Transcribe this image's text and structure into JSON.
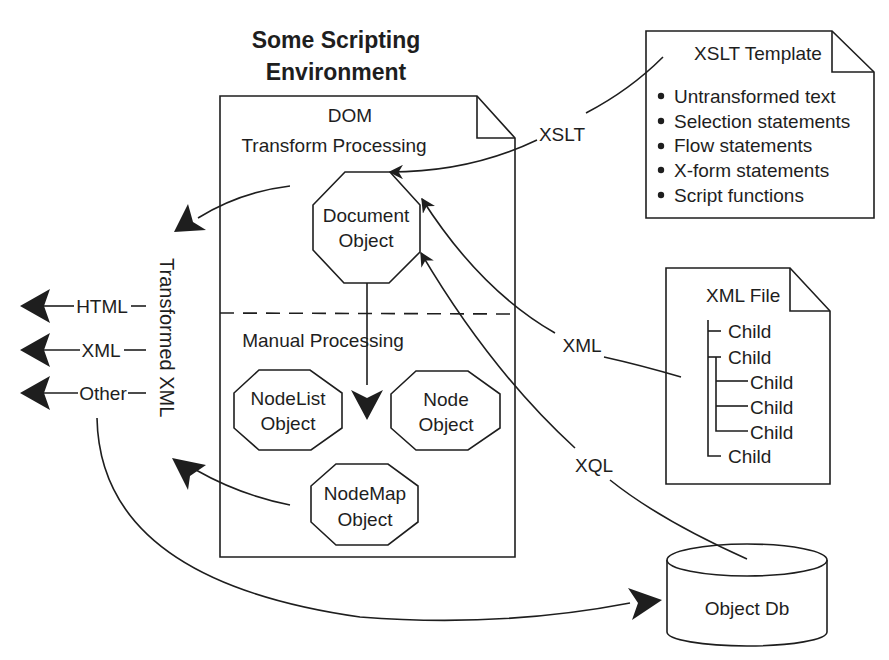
{
  "title": {
    "line1": "Some Scripting",
    "line2": "Environment"
  },
  "dom_page": {
    "heading": "DOM",
    "transform_section": "Transform Processing",
    "manual_section": "Manual Processing",
    "objects": {
      "document": [
        "Document",
        "Object"
      ],
      "nodelist": [
        "NodeList",
        "Object"
      ],
      "node": [
        "Node",
        "Object"
      ],
      "nodemap": [
        "NodeMap",
        "Object"
      ]
    }
  },
  "xslt_template": {
    "title": "XSLT Template",
    "items": [
      "Untransformed text",
      "Selection statements",
      "Flow statements",
      "X-form statements",
      "Script functions"
    ]
  },
  "xml_file": {
    "title": "XML File",
    "tree": [
      {
        "label": "Child",
        "level": 1
      },
      {
        "label": "Child",
        "level": 1
      },
      {
        "label": "Child",
        "level": 2
      },
      {
        "label": "Child",
        "level": 2
      },
      {
        "label": "Child",
        "level": 2
      },
      {
        "label": "Child",
        "level": 1
      }
    ]
  },
  "connectors": {
    "xslt": "XSLT",
    "xml": "XML",
    "xql": "XQL"
  },
  "outputs": {
    "group_label": "Transformed XML",
    "items": [
      "HTML",
      "XML",
      "Other"
    ]
  },
  "database": {
    "label": "Object Db"
  },
  "colors": {
    "ink": "#1e1e1e",
    "background": "#ffffff"
  }
}
